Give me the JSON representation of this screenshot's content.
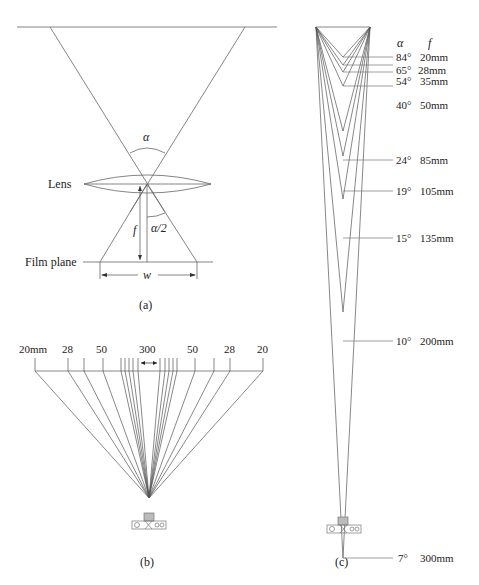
{
  "panel_a": {
    "caption": "(a)",
    "lens_label": "Lens",
    "film_plane_label": "Film plane",
    "alpha_label": "α",
    "half_alpha_label": "α/2",
    "focal_label": "f",
    "width_label": "w"
  },
  "panel_b": {
    "caption": "(b)",
    "tick_labels": [
      "20mm",
      "28",
      "50",
      "300",
      "50",
      "28",
      "20"
    ]
  },
  "panel_c": {
    "caption": "(c)",
    "header_alpha": "α",
    "header_f": "f",
    "rows": [
      {
        "angle": "84°",
        "focal": "20mm"
      },
      {
        "angle": "65°",
        "focal": "28mm"
      },
      {
        "angle": "54°",
        "focal": "35mm"
      },
      {
        "angle": "40°",
        "focal": "50mm"
      },
      {
        "angle": "24°",
        "focal": "85mm"
      },
      {
        "angle": "19°",
        "focal": "105mm"
      },
      {
        "angle": "15°",
        "focal": "135mm"
      },
      {
        "angle": "10°",
        "focal": "200mm"
      },
      {
        "angle": "7°",
        "focal": "300mm"
      }
    ]
  },
  "colors": {
    "line": "#555555",
    "text": "#222222",
    "background": "#ffffff"
  }
}
